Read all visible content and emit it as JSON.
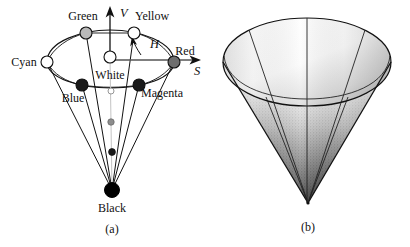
{
  "figure": {
    "panels": [
      {
        "id": "a",
        "caption": "(a)",
        "type": "hexcone-wireframe",
        "axes": [
          {
            "name": "V",
            "label": "V",
            "meaning": "Value",
            "direction": "up",
            "x": 118,
            "y": 14
          },
          {
            "name": "S",
            "label": "S",
            "meaning": "Saturation",
            "direction": "right",
            "x": 196,
            "y": 72
          },
          {
            "name": "H",
            "label": "H",
            "meaning": "Hue",
            "direction": "arc",
            "x": 156,
            "y": 47
          }
        ],
        "vertices": [
          {
            "label": "Green",
            "fill": "#b9b9b9",
            "cx": 86,
            "cy": 33,
            "r": 6.0,
            "tx": 83,
            "ty": 20,
            "anchor": "middle"
          },
          {
            "label": "Yellow",
            "fill": "#ffffff",
            "cx": 134,
            "cy": 33,
            "r": 6.0,
            "tx": 152,
            "ty": 20,
            "anchor": "middle"
          },
          {
            "label": "Cyan",
            "fill": "#ffffff",
            "cx": 47,
            "cy": 62,
            "r": 6.0,
            "tx": 24,
            "ty": 66,
            "anchor": "middle"
          },
          {
            "label": "Red",
            "fill": "#6e6e6e",
            "cx": 174,
            "cy": 62,
            "r": 6.0,
            "tx": 183,
            "ty": 55,
            "anchor": "middle"
          },
          {
            "label": "Blue",
            "fill": "#1a1a1a",
            "cx": 82,
            "cy": 85,
            "r": 6.0,
            "tx": 73,
            "ty": 100,
            "anchor": "middle"
          },
          {
            "label": "Magenta",
            "fill": "#1a1a1a",
            "cx": 139,
            "cy": 85,
            "r": 6.0,
            "tx": 160,
            "ty": 97,
            "anchor": "middle"
          },
          {
            "label": "White",
            "fill": "#ffffff",
            "cx": 110,
            "cy": 57,
            "r": 6.0,
            "tx": 110,
            "ty": 78,
            "anchor": "middle"
          },
          {
            "label": "Black",
            "fill": "#000000",
            "cx": 112,
            "cy": 190,
            "r": 7.5,
            "tx": 112,
            "ty": 212,
            "anchor": "middle"
          }
        ],
        "gray_axis_dots": [
          {
            "fill": "#ffffff",
            "cx": 111,
            "cy": 91,
            "r": 3.0
          },
          {
            "fill": "#8d8d8d",
            "cx": 111,
            "cy": 122,
            "r": 3.2
          },
          {
            "fill": "#1a1a1a",
            "cx": 112,
            "cy": 152,
            "r": 3.4
          }
        ]
      },
      {
        "id": "b",
        "caption": "(b)",
        "type": "shaded-cone",
        "caption_x": 103,
        "caption_y": 231
      }
    ]
  },
  "colors": {
    "stroke": "#111111",
    "light_gray": "#b9b9b9",
    "mid_gray": "#6e6e6e",
    "dark": "#1a1a1a",
    "background": "#ffffff"
  }
}
